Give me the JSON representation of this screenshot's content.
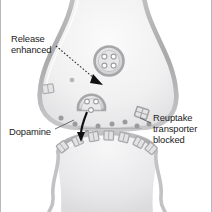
{
  "figure": {
    "labels": {
      "release": "Release\nenhanced",
      "dopamine": "Dopamine",
      "reuptake": "Reuptake\ntransporter\nblocked"
    },
    "colors": {
      "membrane": "#b3b3b5",
      "cytoplasm": "#ededef",
      "cleft_dot": "#9b9b9e",
      "text": "#1c1c1c",
      "frame_border": "#b9b9b9",
      "arrow": "#111111",
      "vesicle_fill": "#d8d8da",
      "receptor": "#c6c6c8"
    },
    "elements": {
      "vesicle_free_dots": 4,
      "vesicle_fusing_dots": 2,
      "cleft_dopamine_dots": 9,
      "postsynaptic_receptors": 7,
      "transporters": 2
    }
  }
}
